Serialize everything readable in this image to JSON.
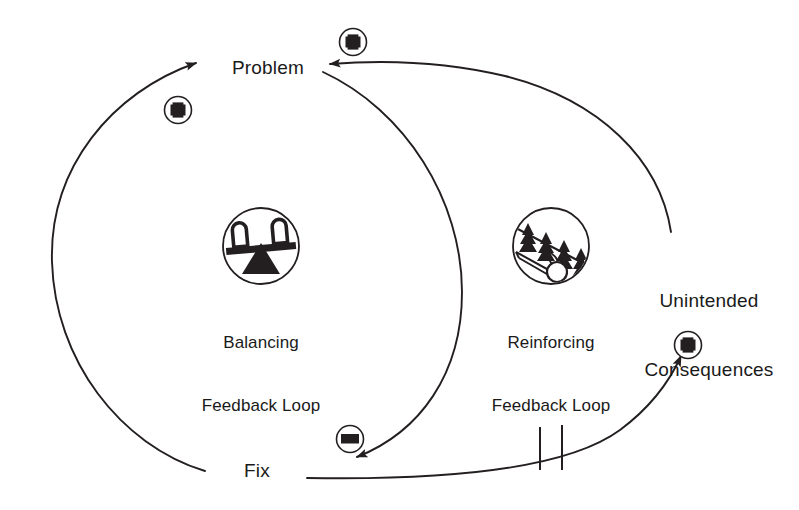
{
  "diagram": {
    "type": "causal-loop-diagram",
    "background_color": "#ffffff",
    "stroke_color": "#231f20",
    "nodes": [
      {
        "id": "problem",
        "label": "Problem",
        "x": 268,
        "y": 56
      },
      {
        "id": "fix",
        "label": "Fix",
        "x": 257,
        "y": 459
      },
      {
        "id": "unintended",
        "label_line1": "Unintended",
        "label_line2": "Consequences",
        "x": 634,
        "y": 243
      }
    ],
    "loops": [
      {
        "id": "balancing",
        "icon": "seesaw-balance-icon",
        "caption_line1": "Balancing",
        "caption_line2": "Feedback Loop",
        "icon_x": 222,
        "icon_y": 207,
        "icon_size": 78,
        "caption_x": 199,
        "caption_y": 290
      },
      {
        "id": "reinforcing",
        "icon": "snowball-hill-icon",
        "caption_line1": "Reinforcing",
        "caption_line2": "Feedback Loop",
        "icon_x": 512,
        "icon_y": 207,
        "icon_size": 78,
        "caption_x": 489,
        "caption_y": 290
      }
    ],
    "polarity_markers": [
      {
        "id": "fix-to-problem",
        "sign": "+",
        "x": 178,
        "y": 110
      },
      {
        "id": "problem-inflow",
        "sign": "+",
        "x": 353,
        "y": 42
      },
      {
        "id": "problem-to-fix",
        "sign": "−",
        "x": 350,
        "y": 439
      },
      {
        "id": "fix-to-unintended",
        "sign": "+",
        "x": 688,
        "y": 345
      }
    ],
    "delay_marker": {
      "id": "delay",
      "label": "delay",
      "x1": 540,
      "x2": 562,
      "y_top": 425,
      "y_bottom": 470
    },
    "links": [
      {
        "id": "fix-to-problem-link",
        "from": "Fix",
        "to": "Problem",
        "polarity": "+",
        "loop": "balancing"
      },
      {
        "id": "problem-to-fix-link",
        "from": "Problem",
        "to": "Fix",
        "polarity": "−",
        "loop": "balancing"
      },
      {
        "id": "fix-to-unintended-link",
        "from": "Fix",
        "to": "Unintended Consequences",
        "polarity": "+",
        "delay": true,
        "loop": "reinforcing"
      },
      {
        "id": "unintended-to-problem-link",
        "from": "Unintended Consequences",
        "to": "Problem",
        "polarity": "+",
        "loop": "reinforcing"
      }
    ]
  }
}
